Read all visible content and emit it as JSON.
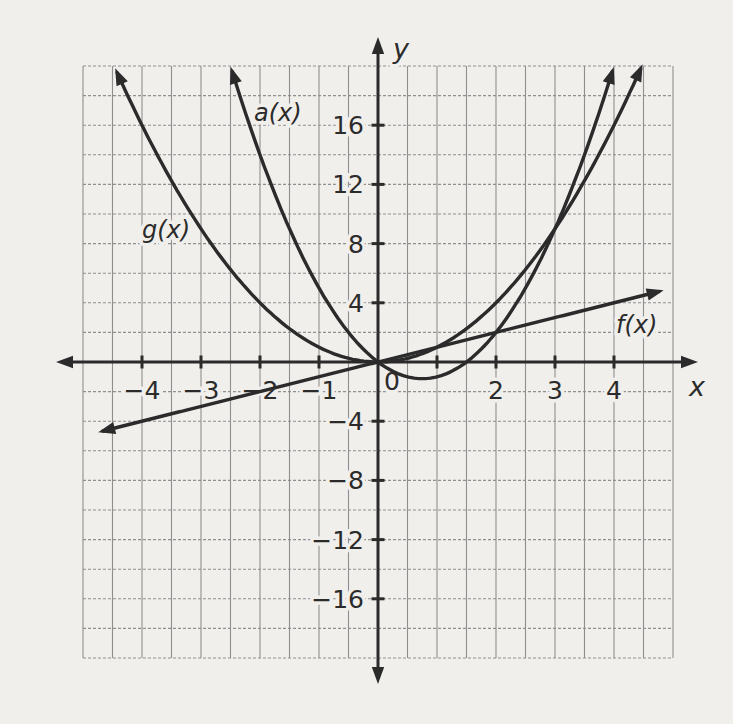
{
  "chart_data": {
    "type": "line",
    "title": "",
    "axes": {
      "xlabel": "x",
      "ylabel": "y",
      "xlim": [
        -5,
        5
      ],
      "ylim": [
        -20,
        20
      ],
      "x_ticks": [
        -4,
        -3,
        -2,
        -1,
        1,
        2,
        3,
        4
      ],
      "x_tick_labels": [
        "−4",
        "−3",
        "−2",
        "−1",
        "",
        "2",
        "3",
        "4"
      ],
      "origin_label": "0",
      "y_ticks": [
        16,
        12,
        8,
        4,
        -4,
        -8,
        -12,
        -16
      ],
      "y_tick_labels": [
        "16",
        "12",
        "8",
        "4",
        "−4",
        "−8",
        "−12",
        "−16"
      ],
      "grid": true,
      "x_units_per_cell": 0.5,
      "y_units_per_cell": 2,
      "grid_cols": 20,
      "grid_rows": 20
    },
    "series": [
      {
        "id": "f",
        "label": "f(x)",
        "kind": "linear",
        "coeffs": {
          "m": 1,
          "b": 0
        },
        "domain": [
          -4.66,
          4.76
        ],
        "arrows": "both",
        "key_points": [
          [
            -4,
            -4
          ],
          [
            0,
            0
          ],
          [
            1,
            1
          ],
          [
            2,
            2
          ],
          [
            4,
            4
          ]
        ]
      },
      {
        "id": "g",
        "label": "g(x)",
        "kind": "quadratic",
        "coeffs": {
          "a": 1,
          "b": 0,
          "c": 0
        },
        "domain": [
          -4.42,
          4.45
        ],
        "arrows": "both",
        "key_points": [
          [
            -4,
            16
          ],
          [
            -2,
            4
          ],
          [
            0,
            0
          ],
          [
            1,
            1
          ],
          [
            2,
            4
          ],
          [
            3,
            9
          ],
          [
            4,
            16
          ]
        ]
      },
      {
        "id": "a",
        "label": "a(x)",
        "kind": "quadratic",
        "coeffs": {
          "a": 2,
          "b": -3,
          "c": 0
        },
        "domain": [
          -2.47,
          3.97
        ],
        "arrows": "both",
        "key_points": [
          [
            -2,
            14
          ],
          [
            -1,
            5
          ],
          [
            0,
            0
          ],
          [
            0.75,
            -1.125
          ],
          [
            1.5,
            0
          ],
          [
            2,
            2
          ],
          [
            3,
            9
          ]
        ]
      }
    ],
    "colors": {
      "paper": "#f1efec",
      "grid_line": "#8f8f8f",
      "axis": "#2b2b2b",
      "curve": "#2b2b2b",
      "label_text": "#2b2b2b"
    },
    "layout_hints": {
      "origin_px": [
        378,
        362
      ],
      "cell_w_px": 29.5,
      "cell_h_px": 29.6,
      "x_axis_px": [
        56,
        698
      ],
      "y_axis_px": [
        37,
        684
      ],
      "series_label_px": {
        "f": [
          616,
          333
        ],
        "g": [
          142,
          238
        ],
        "a": [
          254,
          121
        ]
      },
      "xlabel_px": [
        689,
        396
      ],
      "ylabel_px": [
        393,
        58
      ],
      "tick_font_px": 25,
      "label_font_px": 24
    }
  }
}
